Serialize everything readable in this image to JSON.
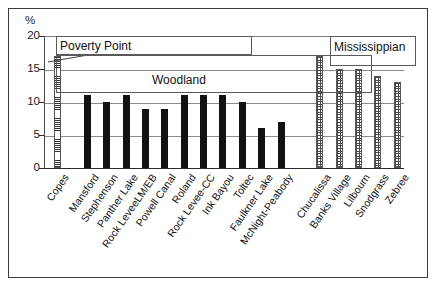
{
  "chart_data": {
    "type": "bar",
    "title": "",
    "xlabel": "",
    "ylabel": "%",
    "ylim": [
      0,
      20
    ],
    "yticks": [
      0,
      5,
      10,
      15,
      20
    ],
    "grid": true,
    "legend_position": "none",
    "categories": [
      "Copes",
      "Mansford",
      "Stephenson",
      "Panther Lake",
      "Rock LeveeLM/EB",
      "Powell Canal",
      "Roland",
      "Rock Levee-CC",
      "Ink Bayou",
      "Toltec",
      "Faulkner Lake",
      "McNight-Peabody",
      "Chucalissa",
      "Banks Village",
      "Lilbourn",
      "Snodgrass",
      "Zebree"
    ],
    "values": [
      17,
      11,
      10,
      11,
      9,
      9,
      11,
      11,
      11,
      10,
      6,
      7,
      17,
      15,
      15,
      14,
      13
    ],
    "groups": [
      {
        "name": "Poverty Point",
        "members": [
          "Copes"
        ],
        "fill": "horizontal-hatch"
      },
      {
        "name": "Woodland",
        "members": [
          "Mansford",
          "Stephenson",
          "Panther Lake",
          "Rock LeveeLM/EB",
          "Powell Canal",
          "Roland",
          "Rock Levee-CC",
          "Ink Bayou",
          "Toltec",
          "Faulkner Lake",
          "McNight-Peabody"
        ],
        "fill": "solid-black"
      },
      {
        "name": "Mississippian",
        "members": [
          "Chucalissa",
          "Banks Village",
          "Lilbourn",
          "Snodgrass",
          "Zebree"
        ],
        "fill": "dotted"
      }
    ],
    "annotations": [
      {
        "label": "Poverty Point",
        "points_to": "Copes"
      },
      {
        "label": "Woodland",
        "points_to": "Woodland group"
      },
      {
        "label": "Mississippian",
        "points_to": "Mississippian group"
      }
    ]
  },
  "axis": {
    "unit_symbol": "%",
    "ytick_labels": [
      "20",
      "15",
      "10",
      "5",
      "0"
    ]
  },
  "annotations": {
    "poverty_point": "Poverty Point",
    "woodland": "Woodland",
    "mississippian": "Mississippian"
  }
}
